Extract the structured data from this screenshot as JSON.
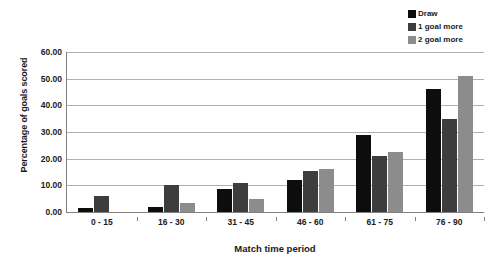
{
  "chart_data": {
    "type": "bar",
    "title": "",
    "xlabel": "Match time period",
    "ylabel": "Percentage of goals scored",
    "categories": [
      "0 - 15",
      "16 - 30",
      "31 - 45",
      "46 - 60",
      "61 - 75",
      "76 - 90"
    ],
    "series": [
      {
        "name": "Draw",
        "color": "#0d0d0d",
        "values": [
          1.5,
          2.0,
          8.5,
          12.0,
          29.0,
          46.0
        ]
      },
      {
        "name": "1 goal more",
        "color": "#3d3d3d",
        "values": [
          6.0,
          10.0,
          11.0,
          15.5,
          21.0,
          35.0
        ]
      },
      {
        "name": "2 goal more",
        "color": "#8c8c8c",
        "values": [
          0.0,
          3.5,
          5.0,
          16.0,
          22.5,
          51.0
        ]
      }
    ],
    "ylim": [
      0,
      60
    ],
    "yticks": [
      0,
      10,
      20,
      30,
      40,
      50,
      60
    ],
    "ytick_labels": [
      "0.00",
      "10.00",
      "20.00",
      "30.00",
      "40.00",
      "50.00",
      "60.00"
    ],
    "grid": true,
    "legend_position": "top-right"
  }
}
